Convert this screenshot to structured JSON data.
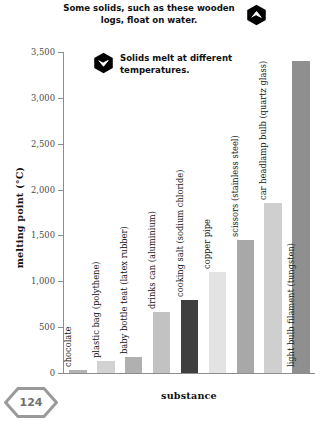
{
  "page": {
    "number": "124"
  },
  "callouts": [
    {
      "icon": "hexagon-chevron-up-icon",
      "text": "Some solids, such as these wooden logs, float on water."
    },
    {
      "icon": "hexagon-chevron-down-icon",
      "text": "Solids melt at different temperatures."
    }
  ],
  "chart_data": {
    "type": "bar",
    "title": "",
    "xlabel": "substance",
    "ylabel": "melting point (°C)",
    "ylim": [
      0,
      3500
    ],
    "grid": false,
    "legend": "none",
    "ytick_labels": [
      "0",
      "500",
      "1,000",
      "1,500",
      "2,000",
      "2,500",
      "3,000",
      "3,500"
    ],
    "ytick_values": [
      0,
      500,
      1000,
      1500,
      2000,
      2500,
      3000,
      3500
    ],
    "categories": [
      "chocolate",
      "plastic bag (polythene)",
      "baby bottle teat (latex rubber)",
      "drinks can (aluminium)",
      "cooking salt (sodium chloride)",
      "copper pipe",
      "scissors (stainless steel)",
      "car headlamp bulb (quartz glass)",
      "light bulb filament (tungsten)"
    ],
    "values": [
      30,
      130,
      180,
      660,
      800,
      1100,
      1450,
      1850,
      3400
    ],
    "bar_colors": [
      "#b3b3b3",
      "#d2d2d2",
      "#b0b0b0",
      "#c2c2c2",
      "#3f3f3f",
      "#e3e3e3",
      "#a8a8a8",
      "#cfcfcf",
      "#8f8f8f"
    ]
  },
  "colors": {
    "axis": "#8d8d8d",
    "text": "#111111",
    "tick_text": "#4b4b4b",
    "badge": "#9a9a9a",
    "icon": "#000000"
  }
}
